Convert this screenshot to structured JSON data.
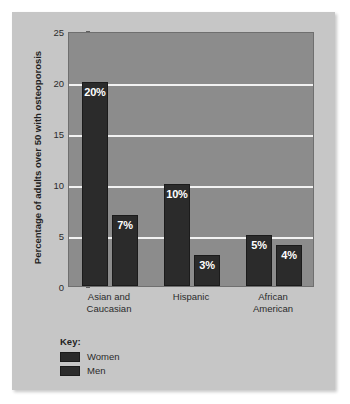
{
  "chart_data": {
    "type": "bar",
    "title": "",
    "xlabel": "",
    "ylabel": "Percentage of adults over 50 with osteoporosis",
    "ylim": [
      0,
      25
    ],
    "yticks": [
      "0",
      "5",
      "10",
      "15",
      "20",
      "25"
    ],
    "grid": true,
    "legend_position": "below-plot-left",
    "categories": [
      "Asian and Caucasian",
      "Hispanic",
      "African American"
    ],
    "category_lines": [
      [
        "Asian and",
        "Caucasian"
      ],
      [
        "Hispanic",
        ""
      ],
      [
        "African",
        "American"
      ]
    ],
    "series": [
      {
        "name": "Women",
        "values": [
          20,
          10,
          5
        ],
        "data_labels": [
          "20%",
          "10%",
          "5%"
        ],
        "color": "#2b2b2b"
      },
      {
        "name": "Men",
        "values": [
          7,
          3,
          4
        ],
        "data_labels": [
          "7%",
          "3%",
          "4%"
        ],
        "color": "#2b2b2b"
      }
    ]
  },
  "legend": {
    "title": "Key:",
    "entries": [
      {
        "label": "Women",
        "color": "#2b2b2b"
      },
      {
        "label": "Men",
        "color": "#2b2b2b"
      }
    ]
  },
  "colors": {
    "page_background": "#ffffff",
    "card_background": "#c6c6c6",
    "plot_background": "#8c8c8c",
    "gridline": "#f2f2f2",
    "bar": "#2b2b2b",
    "text": "#1f1f1f"
  }
}
